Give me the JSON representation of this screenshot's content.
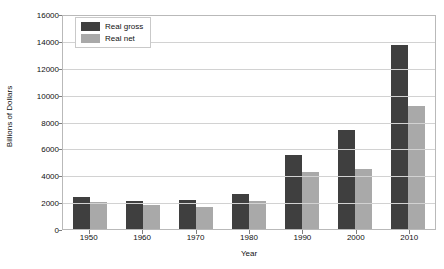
{
  "chart_data": {
    "type": "bar",
    "title": "",
    "xlabel": "Year",
    "ylabel": "Billions of Dollars",
    "categories": [
      "1950",
      "1960",
      "1970",
      "1980",
      "1990",
      "2000",
      "2010"
    ],
    "series": [
      {
        "name": "Real gross",
        "color": "#3f3f3f",
        "values": [
          2350,
          2100,
          2150,
          2600,
          5500,
          7350,
          13700
        ]
      },
      {
        "name": "Real net",
        "color": "#a9a9a9",
        "values": [
          2000,
          1750,
          1650,
          2050,
          4250,
          4500,
          9150
        ]
      }
    ],
    "ylim": [
      0,
      16000
    ],
    "yticks": [
      "0",
      "2000",
      "4000",
      "6000",
      "8000",
      "10000",
      "12000",
      "14000",
      "16000"
    ],
    "ytick_values": [
      0,
      2000,
      4000,
      6000,
      8000,
      10000,
      12000,
      14000,
      16000
    ],
    "grid": true,
    "legend_position": "top-left",
    "legend": [
      "Real gross",
      "Real net"
    ]
  }
}
